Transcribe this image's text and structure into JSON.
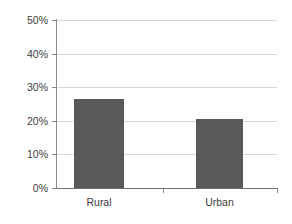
{
  "chart_data": {
    "type": "bar",
    "title": "",
    "subtitle": "",
    "xlabel": "",
    "ylabel": "",
    "categories": [
      "Rural",
      "Urban"
    ],
    "values": [
      26.5,
      20.5
    ],
    "value_labels": [
      "26.5%",
      "20.5%"
    ],
    "series": [
      {
        "name": "",
        "values": [
          26.5,
          20.5
        ],
        "color": "#595959"
      }
    ],
    "ylim": [
      0,
      50
    ],
    "ytick_values": [
      0,
      10,
      20,
      30,
      40,
      50
    ],
    "ytick_labels": [
      "0%",
      "10%",
      "20%",
      "30%",
      "40%",
      "50%"
    ],
    "xtick_labels": [
      "Rural",
      "Urban"
    ],
    "grid": true,
    "grid_axis": "y",
    "grid_color": "#d6d6d6",
    "legend": false,
    "legend_position": "none",
    "bar_color": "#595959",
    "axis_color": "#8a8a8a",
    "background": "#ffffff",
    "annotations": []
  }
}
